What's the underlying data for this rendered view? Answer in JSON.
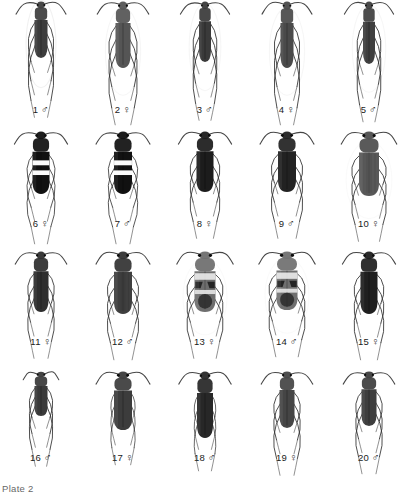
{
  "plate": {
    "label": "Plate 2",
    "background_color": "#ffffff",
    "ink_color": "#1a1a1a",
    "columns": 5,
    "rows": 4,
    "total_specimens": 20
  },
  "rows": [
    {
      "row_index": 1,
      "top": 0,
      "specimens": [
        {
          "number": "1",
          "sex": "♂",
          "sex_name": "male",
          "width": 34,
          "height": 104,
          "body_w": 13,
          "body_h": 56,
          "shade": "#3d3d3d",
          "pattern": "plain-dark",
          "legs": "long-sparse",
          "halo": "strong",
          "clipped_top": true
        },
        {
          "number": "2",
          "sex": "♀",
          "sex_name": "female",
          "width": 40,
          "height": 104,
          "body_w": 15,
          "body_h": 66,
          "shade": "#555555",
          "pattern": "plain-dark",
          "legs": "long-sparse",
          "halo": "medium",
          "clipped_top": true
        },
        {
          "number": "3",
          "sex": "♂",
          "sex_name": "male",
          "width": 36,
          "height": 104,
          "body_w": 12,
          "body_h": 60,
          "shade": "#3a3a3a",
          "pattern": "plain-dark",
          "legs": "long-sparse",
          "halo": "medium",
          "clipped_top": true
        },
        {
          "number": "4",
          "sex": "♀",
          "sex_name": "female",
          "width": 40,
          "height": 104,
          "body_w": 13,
          "body_h": 66,
          "shade": "#4a4a4a",
          "pattern": "plain-dark",
          "legs": "long-sparse",
          "halo": "medium",
          "clipped_top": true
        },
        {
          "number": "5",
          "sex": "♂",
          "sex_name": "male",
          "width": 38,
          "height": 104,
          "body_w": 12,
          "body_h": 62,
          "shade": "#3f3f3f",
          "pattern": "plain-dark",
          "legs": "long-sparse",
          "halo": "medium",
          "clipped_top": true
        }
      ]
    },
    {
      "row_index": 2,
      "top": 126,
      "specimens": [
        {
          "number": "6",
          "sex": "♀",
          "sex_name": "female",
          "width": 46,
          "height": 92,
          "body_w": 17,
          "body_h": 62,
          "shade": "#111111",
          "pattern": "banded",
          "bands": 2,
          "legs": "long-thin",
          "halo": "none",
          "clipped_top": false
        },
        {
          "number": "7",
          "sex": "♂",
          "sex_name": "male",
          "width": 48,
          "height": 92,
          "body_w": 18,
          "body_h": 62,
          "shade": "#111111",
          "pattern": "banded",
          "bands": 2,
          "legs": "long-thin",
          "halo": "none",
          "clipped_top": false
        },
        {
          "number": "8",
          "sex": "♀",
          "sex_name": "female",
          "width": 48,
          "height": 92,
          "body_w": 17,
          "body_h": 60,
          "shade": "#1c1c1c",
          "pattern": "plain-dark",
          "legs": "sprawled",
          "halo": "none",
          "clipped_top": false
        },
        {
          "number": "9",
          "sex": "♂",
          "sex_name": "male",
          "width": 50,
          "height": 92,
          "body_w": 18,
          "body_h": 60,
          "shade": "#222222",
          "pattern": "plain-dark",
          "legs": "sprawled",
          "halo": "none",
          "clipped_top": false
        },
        {
          "number": "10",
          "sex": "♀",
          "sex_name": "female",
          "width": 52,
          "height": 92,
          "body_w": 20,
          "body_h": 64,
          "shade": "#4e4e4e",
          "pattern": "striate-gray",
          "legs": "sprawled",
          "halo": "soft",
          "clipped_top": false
        }
      ]
    },
    {
      "row_index": 3,
      "top": 246,
      "specimens": [
        {
          "number": "11",
          "sex": "♀",
          "sex_name": "female",
          "width": 44,
          "height": 90,
          "body_w": 15,
          "body_h": 60,
          "shade": "#2e2e2e",
          "pattern": "plain-dark",
          "legs": "sprawled",
          "halo": "none",
          "clipped_top": false
        },
        {
          "number": "12",
          "sex": "♂",
          "sex_name": "male",
          "width": 48,
          "height": 90,
          "body_w": 18,
          "body_h": 62,
          "shade": "#333333",
          "pattern": "striate-dark",
          "legs": "sprawled",
          "halo": "none",
          "clipped_top": false
        },
        {
          "number": "13",
          "sex": "♀",
          "sex_name": "female",
          "width": 50,
          "height": 90,
          "body_w": 21,
          "body_h": 60,
          "shade": "#6e6e6e",
          "pattern": "mottled",
          "legs": "sprawled",
          "halo": "soft",
          "clipped_top": false
        },
        {
          "number": "14",
          "sex": "♂",
          "sex_name": "male",
          "width": 50,
          "height": 90,
          "body_w": 21,
          "body_h": 58,
          "shade": "#707070",
          "pattern": "mottled",
          "legs": "sprawled",
          "halo": "soft",
          "clipped_top": false
        },
        {
          "number": "15",
          "sex": "♀",
          "sex_name": "female",
          "width": 46,
          "height": 90,
          "body_w": 17,
          "body_h": 62,
          "shade": "#1f1f1f",
          "pattern": "plain-dark",
          "legs": "sprawled",
          "halo": "none",
          "clipped_top": false
        }
      ]
    },
    {
      "row_index": 4,
      "top": 366,
      "specimens": [
        {
          "number": "16",
          "sex": "♂",
          "sex_name": "male",
          "width": 40,
          "height": 86,
          "body_w": 13,
          "body_h": 44,
          "shade": "#3a3a3a",
          "pattern": "plain-dark",
          "legs": "sprawled",
          "halo": "none",
          "clipped_top": false,
          "small": true
        },
        {
          "number": "17",
          "sex": "♀",
          "sex_name": "female",
          "width": 44,
          "height": 86,
          "body_w": 18,
          "body_h": 58,
          "shade": "#3c3c3c",
          "pattern": "plain-dark",
          "legs": "short",
          "halo": "none",
          "clipped_top": false
        },
        {
          "number": "18",
          "sex": "♂",
          "sex_name": "male",
          "width": 44,
          "height": 86,
          "body_w": 16,
          "body_h": 66,
          "shade": "#272727",
          "pattern": "plain-dark",
          "legs": "short",
          "halo": "none",
          "clipped_top": false
        },
        {
          "number": "19",
          "sex": "♀",
          "sex_name": "female",
          "width": 44,
          "height": 86,
          "body_w": 15,
          "body_h": 56,
          "shade": "#454545",
          "pattern": "plain-dark",
          "legs": "sprawled",
          "halo": "none",
          "clipped_top": false
        },
        {
          "number": "20",
          "sex": "♂",
          "sex_name": "male",
          "width": 44,
          "height": 86,
          "body_w": 15,
          "body_h": 54,
          "shade": "#3e3e3e",
          "pattern": "plain-dark",
          "legs": "sprawled",
          "halo": "none",
          "clipped_top": false
        }
      ]
    }
  ]
}
